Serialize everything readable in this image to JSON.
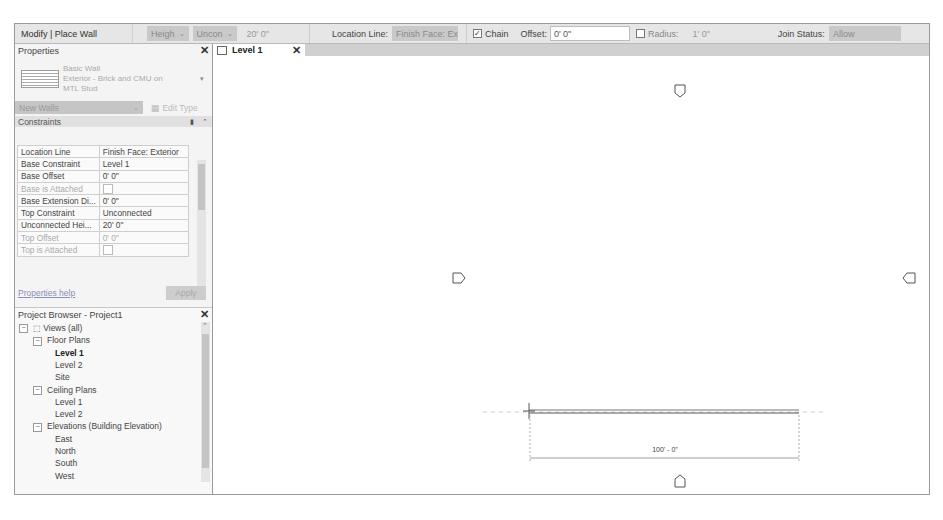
{
  "options_bar": {
    "context": "Modify | Place Wall",
    "height_mode": "Heigh",
    "height_target": "Uncon",
    "height_value": "20' 0\"",
    "location_line_label": "Location Line:",
    "location_line_value": "Finish Face: Ex",
    "chain_label": "Chain",
    "chain_checked": true,
    "offset_label": "Offset:",
    "offset_value": "0' 0\"",
    "radius_label": "Radius:",
    "radius_checked": false,
    "radius_value": "1' 0\"",
    "join_status_label": "Join Status:",
    "join_status_value": "Allow"
  },
  "properties": {
    "title": "Properties",
    "type_family": "Basic Wall",
    "type_name_line1": "Exterior - Brick and CMU on",
    "type_name_line2": "MTL Stud",
    "instance_selector": "New Walls",
    "edit_type_label": "Edit Type",
    "section": "Constraints",
    "rows": [
      {
        "key": "Location Line",
        "value": "Finish Face: Exterior",
        "dim": false,
        "checkbox": false
      },
      {
        "key": "Base Constraint",
        "value": "Level 1",
        "dim": false,
        "checkbox": false
      },
      {
        "key": "Base Offset",
        "value": "0' 0\"",
        "dim": false,
        "checkbox": false
      },
      {
        "key": "Base is Attached",
        "value": "",
        "dim": true,
        "checkbox": true
      },
      {
        "key": "Base Extension Di...",
        "value": "0' 0\"",
        "dim": false,
        "checkbox": false
      },
      {
        "key": "Top Constraint",
        "value": "Unconnected",
        "dim": false,
        "checkbox": false
      },
      {
        "key": "Unconnected Hei...",
        "value": "20' 0\"",
        "dim": false,
        "checkbox": false
      },
      {
        "key": "Top Offset",
        "value": "0' 0\"",
        "dim": true,
        "checkbox": false
      },
      {
        "key": "Top is Attached",
        "value": "",
        "dim": true,
        "checkbox": true
      }
    ],
    "help_link": "Properties help",
    "apply_label": "Apply"
  },
  "project_browser": {
    "title": "Project Browser - Project1",
    "items": [
      {
        "label": "Views (all)",
        "level": 0,
        "toggle": "−"
      },
      {
        "label": "Floor Plans",
        "level": 1,
        "toggle": "−"
      },
      {
        "label": "Level 1",
        "level": 2,
        "bold": true
      },
      {
        "label": "Level 2",
        "level": 2
      },
      {
        "label": "Site",
        "level": 2
      },
      {
        "label": "Ceiling Plans",
        "level": 1,
        "toggle": "−"
      },
      {
        "label": "Level 1",
        "level": 2
      },
      {
        "label": "Level 2",
        "level": 2
      },
      {
        "label": "Elevations (Building Elevation)",
        "level": 1,
        "toggle": "−"
      },
      {
        "label": "East",
        "level": 2
      },
      {
        "label": "North",
        "level": 2
      },
      {
        "label": "South",
        "level": 2
      },
      {
        "label": "West",
        "level": 2
      }
    ]
  },
  "view_tab": {
    "label": "Level 1"
  },
  "canvas": {
    "dimension_label": "100' - 0\"",
    "elevation_markers": [
      "north",
      "west",
      "east",
      "south"
    ]
  }
}
